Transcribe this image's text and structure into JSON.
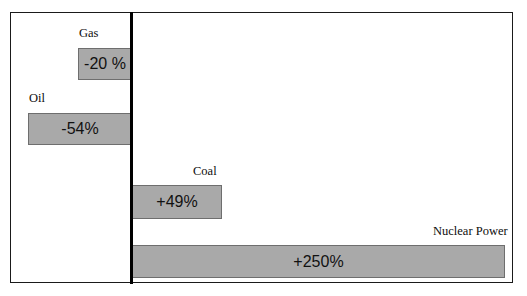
{
  "chart_data": {
    "type": "bar",
    "orientation": "horizontal",
    "title": "",
    "subtitle": "",
    "xlabel": "",
    "ylabel": "",
    "grid": false,
    "legend": null,
    "zero_baseline": true,
    "categories": [
      "Gas",
      "Oil",
      "Coal",
      "Nuclear Power"
    ],
    "values": [
      -20,
      -54,
      49,
      250
    ],
    "value_labels": [
      "-20 %",
      "-54%",
      "+49%",
      "+250%"
    ],
    "xlim": [
      -100,
      280
    ],
    "series": [
      {
        "name": "Percent change",
        "values": [
          -20,
          -54,
          49,
          250
        ]
      }
    ],
    "bars": [
      {
        "category": "Gas",
        "value": -20,
        "value_label": "-20 %",
        "direction": "left"
      },
      {
        "category": "Oil",
        "value": -54,
        "value_label": "-54%",
        "direction": "left"
      },
      {
        "category": "Coal",
        "value": 49,
        "value_label": "+49%",
        "direction": "right"
      },
      {
        "category": "Nuclear Power",
        "value": 250,
        "value_label": "+250%",
        "direction": "right"
      }
    ],
    "colors": {
      "bar_fill": "#a9a9a9",
      "bar_border": "#6e6e6e",
      "axis": "#000000",
      "frame": "#1a1a1a",
      "background": "#ffffff",
      "text": "#0d0d0d"
    }
  }
}
